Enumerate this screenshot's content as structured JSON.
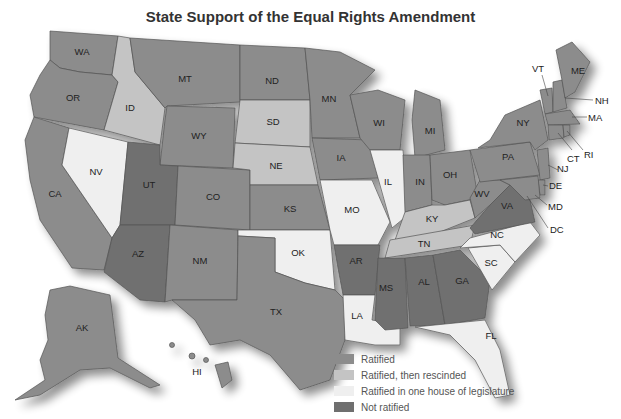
{
  "title": "State Support of the Equal Rights Amendment",
  "colors": {
    "ratified": "#8c8c8c",
    "rescinded": "#c4c4c4",
    "one_house": "#efefef",
    "not_ratified": "#6f6f6f"
  },
  "legend": [
    {
      "key": "ratified",
      "label": "Ratified",
      "color": "#8c8c8c"
    },
    {
      "key": "rescinded",
      "label": "Ratified, then rescinded",
      "color": "#c4c4c4"
    },
    {
      "key": "one_house",
      "label": "Ratified in one house of legislature",
      "color": "#efefef"
    },
    {
      "key": "not_ratified",
      "label": "Not ratified",
      "color": "#6f6f6f"
    }
  ],
  "states": {
    "ratified": [
      "WA",
      "OR",
      "CA",
      "MT",
      "WY",
      "CO",
      "ND",
      "MN",
      "IA",
      "KS",
      "NM",
      "TX",
      "WI",
      "MI",
      "IN",
      "OH",
      "WV",
      "PA",
      "NY",
      "VT",
      "ME",
      "NH",
      "MA",
      "CT",
      "RI",
      "NJ",
      "DE",
      "MD",
      "DC",
      "AK",
      "HI"
    ],
    "rescinded": [
      "ID",
      "SD",
      "NE",
      "KY",
      "TN"
    ],
    "one_house": [
      "NV",
      "IL",
      "MO",
      "OK",
      "NC",
      "SC",
      "LA",
      "FL"
    ],
    "not_ratified": [
      "UT",
      "AZ",
      "AR",
      "MS",
      "AL",
      "GA",
      "VA"
    ]
  },
  "labels": {
    "WA": "WA",
    "OR": "OR",
    "CA": "CA",
    "ID": "ID",
    "NV": "NV",
    "MT": "MT",
    "WY": "WY",
    "UT": "UT",
    "CO": "CO",
    "AZ": "AZ",
    "NM": "NM",
    "ND": "ND",
    "SD": "SD",
    "NE": "NE",
    "KS": "KS",
    "OK": "OK",
    "TX": "TX",
    "MN": "MN",
    "IA": "IA",
    "MO": "MO",
    "AR": "AR",
    "LA": "LA",
    "WI": "WI",
    "IL": "IL",
    "MI": "MI",
    "IN": "IN",
    "OH": "OH",
    "KY": "KY",
    "TN": "TN",
    "MS": "MS",
    "AL": "AL",
    "GA": "GA",
    "FL": "FL",
    "SC": "SC",
    "NC": "NC",
    "VA": "VA",
    "WV": "WV",
    "PA": "PA",
    "NY": "NY",
    "VT": "VT",
    "ME": "ME",
    "NH": "NH",
    "MA": "MA",
    "RI": "RI",
    "CT": "CT",
    "NJ": "NJ",
    "DE": "DE",
    "MD": "MD",
    "DC": "DC",
    "AK": "AK",
    "HI": "HI"
  }
}
